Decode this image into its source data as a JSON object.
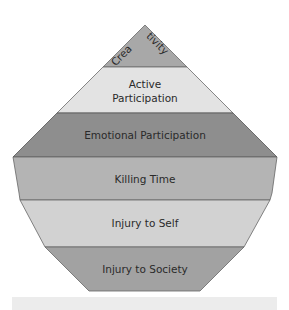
{
  "diagram": {
    "type": "pyramid",
    "layers": [
      {
        "label": "Creativity",
        "label_part1": "Crea",
        "label_part2": "tivity",
        "color": "#a8a8a8"
      },
      {
        "label": "Active Participation",
        "line1": "Active",
        "line2": "Participation",
        "color": "#e3e3e3"
      },
      {
        "label": "Emotional Participation",
        "color": "#8e8e8e"
      },
      {
        "label": "Killing Time",
        "color": "#b4b4b4"
      },
      {
        "label": "Injury to Self",
        "color": "#d2d2d2"
      },
      {
        "label": "Injury to Society",
        "color": "#a2a2a2"
      }
    ],
    "edge_color": "#555555",
    "footer_bar_color": "#ececec"
  }
}
